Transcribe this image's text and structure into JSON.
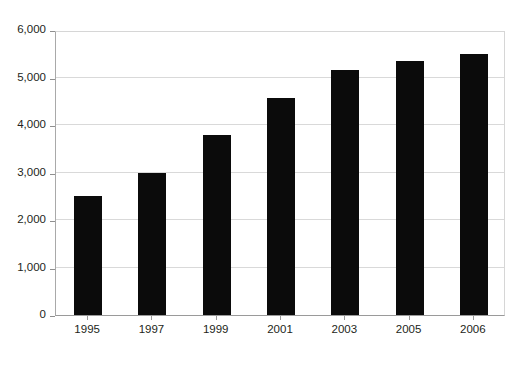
{
  "chart_data": {
    "type": "bar",
    "title": "",
    "subtitle": "",
    "xlabel": "",
    "ylabel": "",
    "categories": [
      "1995",
      "1997",
      "1999",
      "2001",
      "2003",
      "2005",
      "2006"
    ],
    "values": [
      2500,
      3000,
      3800,
      4570,
      5150,
      5350,
      5500
    ],
    "series": [
      {
        "name": "",
        "values": [
          2500,
          3000,
          3800,
          4570,
          5150,
          5350,
          5500
        ]
      }
    ],
    "ylim": [
      0,
      6000
    ],
    "ytick_values": [
      0,
      1000,
      2000,
      3000,
      4000,
      5000,
      6000
    ],
    "ytick_labels": [
      "0",
      "1,000",
      "2,000",
      "3,000",
      "4,000",
      "5,000",
      "6,000"
    ],
    "grid": true,
    "grid_axis": "y",
    "legend": false,
    "legend_position": "none",
    "bar_color": "#0b0b0b",
    "gridline_color": "#d9d9d9",
    "axis_color": "#9a9a9a",
    "background_color": "#ffffff",
    "text_color": "#231f20",
    "annotations": []
  },
  "figure": {
    "title_sliver": "",
    "width": 519,
    "height": 365
  }
}
